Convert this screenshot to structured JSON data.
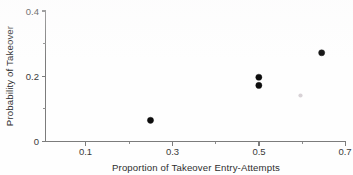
{
  "chart_data": {
    "type": "scatter",
    "title": "",
    "xlabel": "Proportion of Takeover  Entry-Attempts",
    "ylabel": "Probability of Takeover",
    "xlim": [
      0.045,
      0.7
    ],
    "ylim": [
      0.0,
      0.4
    ],
    "grid": false,
    "legend": null,
    "x_major_ticks": [
      0.1,
      0.3,
      0.5,
      0.7
    ],
    "x_major_tick_labels": [
      "0.1",
      "0.3",
      "0.5",
      "0.7"
    ],
    "x_minor_ticks": [
      0.2,
      0.4,
      0.6
    ],
    "y_major_ticks": [
      0,
      0.2,
      0.4
    ],
    "y_major_tick_labels": [
      "0",
      "0.2",
      "0.4"
    ],
    "y_minor_ticks": [
      0.1,
      0.3
    ],
    "marker": "filled-circle",
    "marker_color": "#0d0d0d",
    "axis_color": "#7c7c7c",
    "points": [
      {
        "x": 0.25,
        "y": 0.065
      },
      {
        "x": 0.5,
        "y": 0.197
      },
      {
        "x": 0.5,
        "y": 0.172
      },
      {
        "x": 0.645,
        "y": 0.272
      }
    ]
  },
  "axes": {
    "x_title": "Proportion of Takeover  Entry-Attempts",
    "y_title": "Probability of Takeover",
    "x_tick_labels": [
      "0.1",
      "0.3",
      "0.5",
      "0.7"
    ],
    "y_tick_labels": [
      "0",
      "0.2",
      "0.4"
    ]
  }
}
